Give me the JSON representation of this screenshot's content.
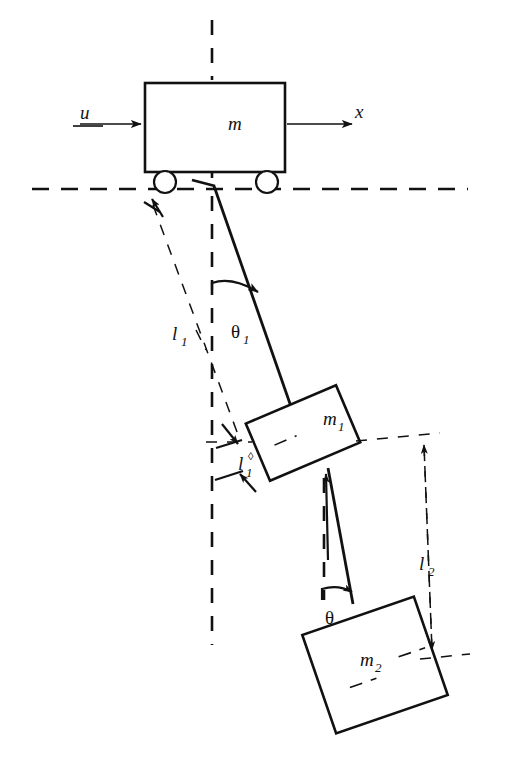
{
  "figure": {
    "background_color": "#ffffff",
    "line_color": "#111111",
    "width": 520,
    "height": 769
  },
  "labels": {
    "cart_mass": "m",
    "input_force": "u",
    "position_axis": "x",
    "link1_length": "l",
    "link1_length_sub": "1",
    "link1_offset": "l",
    "link1_offset_sub": "1",
    "link1_offset_sup": "◊",
    "link2_length": "l",
    "link2_length_sub": "2",
    "mass1": "m",
    "mass1_sub": "1",
    "mass2": "m",
    "mass2_sub": "2",
    "angle1": "θ",
    "angle1_sub": "1",
    "angle2": "θ",
    "angle2_sub": "2"
  },
  "elements": {
    "cart": "cart-body",
    "wheel_left": "left-wheel",
    "wheel_right": "right-wheel",
    "ground": "ground-reference-line",
    "vertical_axis": "vertical-reference-axis",
    "rod1": "upper-pendulum-rod",
    "rod2": "lower-pendulum-rod",
    "block1": "first-pendulum-mass-block",
    "block2": "second-pendulum-mass-block"
  }
}
